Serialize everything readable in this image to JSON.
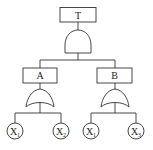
{
  "diagram": {
    "type": "fault-tree",
    "top_event": {
      "label": "T",
      "gate": "AND"
    },
    "intermediate_events": [
      {
        "label": "A",
        "gate": "OR",
        "children": [
          {
            "base": "X",
            "sub": "1"
          },
          {
            "base": "X",
            "sub": "2"
          }
        ]
      },
      {
        "label": "B",
        "gate": "OR",
        "children": [
          {
            "base": "X",
            "sub": "1"
          },
          {
            "base": "X",
            "sub": "3"
          }
        ]
      }
    ],
    "colors": {
      "stroke": "#333333",
      "background": "#ffffff"
    }
  }
}
